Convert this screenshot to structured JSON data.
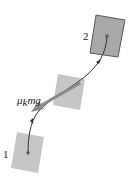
{
  "diagram": {
    "type": "physics-free-body",
    "labels": {
      "position_2": "2",
      "position_1": "1",
      "force_mu": "μ",
      "force_sub": "k",
      "force_rest": "mg"
    },
    "colors": {
      "block_fill_dark": "#a9a9a9",
      "block_fill_light": "#c4c4c4",
      "block_stroke": "#555555",
      "path": "#333333",
      "force_arrow": "#8a8a8a",
      "dot": "#777777"
    },
    "blocks": [
      {
        "name": "block-position-2",
        "points": "96,15 125,20 118,57 90,53",
        "center": [
          107,
          36
        ]
      },
      {
        "name": "block-middle",
        "points": "58,74 85,79 80,110 53,105",
        "center": [
          68,
          92
        ]
      },
      {
        "name": "block-position-1",
        "points": "17,132 44,137 38,173 11,168",
        "center": [
          28,
          153
        ]
      }
    ]
  }
}
